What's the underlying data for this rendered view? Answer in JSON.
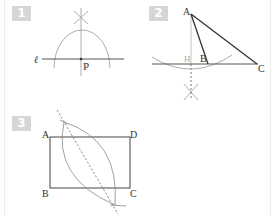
{
  "figures": [
    {
      "number": "1",
      "labels": {
        "line": "ℓ",
        "point": "P"
      },
      "description": "Perpendicular to line ℓ through point P, constructed with arcs"
    },
    {
      "number": "2",
      "labels": {
        "a": "A",
        "b": "B",
        "c": "C",
        "h": "H"
      },
      "description": "Triangle ABC with altitude from A to extended line BC at H"
    },
    {
      "number": "3",
      "labels": {
        "a": "A",
        "b": "B",
        "c": "C",
        "d": "D"
      },
      "description": "Rectangle ABCD with perpendicular bisector of diagonal AC"
    }
  ],
  "colors": {
    "line": "#333333",
    "construction": "#999999",
    "badge": "#d6d6d6"
  }
}
